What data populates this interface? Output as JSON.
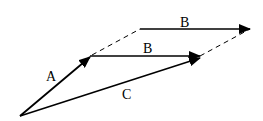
{
  "diagram": {
    "labels": {
      "a": "A",
      "b_upper": "B",
      "b_lower": "B",
      "c": "C"
    },
    "vectors": [
      {
        "name": "A",
        "from": [
          20,
          116
        ],
        "to": [
          90,
          57
        ]
      },
      {
        "name": "B",
        "from": [
          90,
          56
        ],
        "to": [
          200,
          56
        ]
      },
      {
        "name": "B",
        "from": [
          140,
          29
        ],
        "to": [
          249,
          29
        ]
      },
      {
        "name": "C",
        "from": [
          20,
          116
        ],
        "to": [
          200,
          57
        ]
      }
    ],
    "dashed": [
      {
        "from": [
          90,
          55
        ],
        "to": [
          140,
          29
        ]
      },
      {
        "from": [
          200,
          56
        ],
        "to": [
          249,
          29
        ]
      }
    ],
    "colors": {
      "stroke": "#000000",
      "background": "#ffffff"
    }
  }
}
